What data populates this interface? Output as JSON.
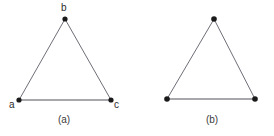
{
  "figure": {
    "background_color": "#ffffff",
    "edge_color": "#6e6e78",
    "base_edge_color": "#8a8a90",
    "vertex_color": "#1a1a1a",
    "panels": [
      {
        "id": "panel-a",
        "caption": "(a)",
        "caption_pos": {
          "x": 64,
          "y": 120
        },
        "vertices": [
          {
            "name": "a",
            "label": "a",
            "x": 19,
            "y": 100,
            "label_x": 9,
            "label_y": 105
          },
          {
            "name": "b",
            "label": "b",
            "x": 65,
            "y": 19,
            "label_x": 63,
            "label_y": 8
          },
          {
            "name": "c",
            "label": "c",
            "x": 111,
            "y": 100,
            "label_x": 117,
            "label_y": 105
          }
        ],
        "edges": [
          {
            "from": "a",
            "to": "b"
          },
          {
            "from": "b",
            "to": "c"
          },
          {
            "from": "a",
            "to": "c"
          }
        ]
      },
      {
        "id": "panel-b",
        "caption": "(b)",
        "caption_pos": {
          "x": 212,
          "y": 120
        },
        "vertices": [
          {
            "name": "left",
            "label": "",
            "x": 167,
            "y": 99
          },
          {
            "name": "apex",
            "label": "",
            "x": 214,
            "y": 19
          },
          {
            "name": "right",
            "label": "",
            "x": 255,
            "y": 99
          }
        ],
        "edges": [
          {
            "from": "left",
            "to": "apex"
          },
          {
            "from": "apex",
            "to": "right"
          },
          {
            "from": "left",
            "to": "right"
          }
        ]
      }
    ]
  }
}
